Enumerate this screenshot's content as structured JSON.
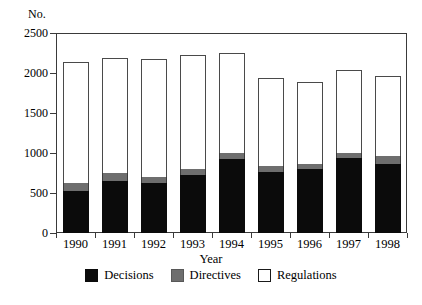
{
  "chart_data": {
    "type": "bar",
    "stacked": true,
    "title": "",
    "xlabel": "Year",
    "ylabel": "No.",
    "ylim": [
      0,
      2500
    ],
    "yticks": [
      0,
      500,
      1000,
      1500,
      2000,
      2500
    ],
    "grid": false,
    "legend_position": "bottom",
    "categories": [
      "1990",
      "1991",
      "1992",
      "1993",
      "1994",
      "1995",
      "1996",
      "1997",
      "1998"
    ],
    "series": [
      {
        "name": "Decisions",
        "color": "#0b0b0b",
        "values": [
          520,
          650,
          620,
          730,
          920,
          760,
          800,
          935,
          860
        ]
      },
      {
        "name": "Directives",
        "color": "#6e6e6e",
        "values": [
          110,
          95,
          85,
          75,
          80,
          80,
          65,
          70,
          100
        ]
      },
      {
        "name": "Regulations",
        "color": "#ffffff",
        "values": [
          1510,
          1445,
          1475,
          1415,
          1255,
          1100,
          1025,
          1035,
          1000
        ]
      }
    ],
    "totals": [
      2140,
      2190,
      2180,
      2220,
      2255,
      1940,
      1890,
      2040,
      1960
    ]
  },
  "legend": {
    "items": [
      {
        "label": "Decisions"
      },
      {
        "label": "Directives"
      },
      {
        "label": "Regulations"
      }
    ]
  }
}
